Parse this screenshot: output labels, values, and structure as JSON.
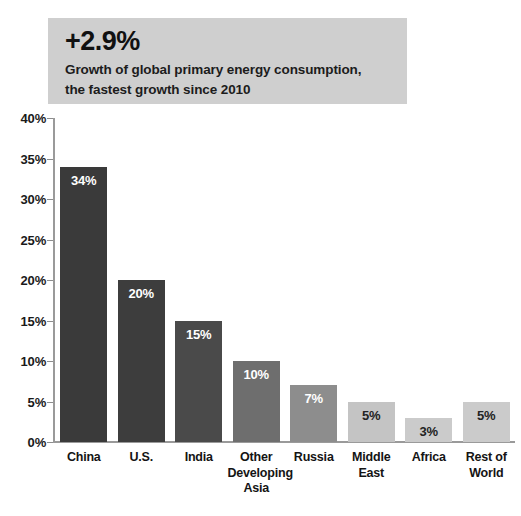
{
  "header": {
    "headline": "+2.9%",
    "subline_1": "Growth of global primary energy consumption,",
    "subline_2": "the fastest growth since 2010",
    "background_color": "#cfcfcf"
  },
  "chart_data": {
    "type": "bar",
    "title": "",
    "subtitle": "",
    "xlabel": "",
    "ylabel": "",
    "ylim": [
      0,
      40
    ],
    "grid": false,
    "legend": "none",
    "y_ticks": [
      "0%",
      "5%",
      "10%",
      "15%",
      "20%",
      "25%",
      "30%",
      "35%",
      "40%"
    ],
    "y_tick_values": [
      0,
      5,
      10,
      15,
      20,
      25,
      30,
      35,
      40
    ],
    "categories": [
      "China",
      "U.S.",
      "India",
      "Other Developing Asia",
      "Russia",
      "Middle East",
      "Africa",
      "Rest of World"
    ],
    "values": [
      34,
      20,
      15,
      10,
      7,
      5,
      3,
      5
    ],
    "data_labels": [
      "34%",
      "20%",
      "15%",
      "10%",
      "7%",
      "5%",
      "3%",
      "5%"
    ],
    "bar_colors": [
      "#3a3a3a",
      "#3d3d3d",
      "#4a4a4a",
      "#6e6e6e",
      "#8d8d8d",
      "#c4c4c4",
      "#cbcbcb",
      "#cbcbcb"
    ],
    "label_colors": [
      "#ffffff",
      "#ffffff",
      "#ffffff",
      "#ffffff",
      "#ffffff",
      "#232323",
      "#232323",
      "#232323"
    ],
    "category_lines": [
      [
        "China"
      ],
      [
        "U.S."
      ],
      [
        "India"
      ],
      [
        "Other",
        "Developing",
        "Asia"
      ],
      [
        "Russia"
      ],
      [
        "Middle",
        "East"
      ],
      [
        "Africa"
      ],
      [
        "Rest of",
        "World"
      ]
    ],
    "axis_color": "#9a9a9a"
  }
}
